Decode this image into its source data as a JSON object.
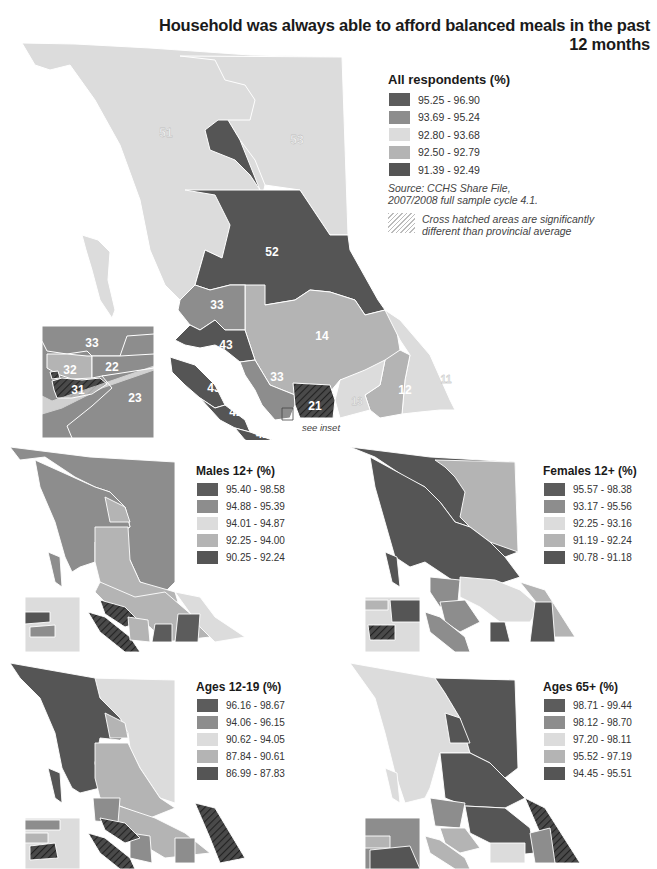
{
  "title": "Household was always able to afford balanced meals in the past 12 months",
  "colors": {
    "class1": "#5c5c5c",
    "class2": "#8d8d8d",
    "class3": "#dcdcdc",
    "class4": "#b4b4b4",
    "class5": "#555555",
    "boundary": "#ffffff"
  },
  "main_map": {
    "legend": {
      "title": "All respondents (%)",
      "classes": [
        {
          "label": "95.25 - 96.90"
        },
        {
          "label": "93.69 - 95.24"
        },
        {
          "label": "92.80 - 93.68"
        },
        {
          "label": "92.50 - 92.79"
        },
        {
          "label": "91.39 - 92.49"
        }
      ]
    },
    "source_line1": "Source: CCHS Share File,",
    "source_line2": "2007/2008 full sample cycle 4.1.",
    "hatch_line1": "Cross hatched areas are significantly",
    "hatch_line2": "different than provincial average",
    "see_inset": "see inset",
    "region_labels": {
      "r51": "51",
      "r53": "53",
      "r52": "52",
      "r33": "33",
      "r14": "14",
      "r43a": "43",
      "r43b": "43",
      "r33b": "33",
      "r42": "42",
      "r41": "41",
      "r21": "21",
      "r13": "13",
      "r12": "12",
      "r11": "11"
    },
    "inset_labels": {
      "i33": "33",
      "i22": "22",
      "i32": "32",
      "i31": "31",
      "i23": "23"
    }
  },
  "small_maps": [
    {
      "id": "males",
      "legend": {
        "title": "Males 12+ (%)",
        "classes": [
          {
            "label": "95.40 - 98.58"
          },
          {
            "label": "94.88 - 95.39"
          },
          {
            "label": "94.01 - 94.87"
          },
          {
            "label": "92.25 - 94.00"
          },
          {
            "label": "90.25 - 92.24"
          }
        ]
      }
    },
    {
      "id": "females",
      "legend": {
        "title": "Females 12+ (%)",
        "classes": [
          {
            "label": "95.57 - 98.38"
          },
          {
            "label": "93.17 - 95.56"
          },
          {
            "label": "92.25 - 93.16"
          },
          {
            "label": "91.19 - 92.24"
          },
          {
            "label": "90.78 - 91.18"
          }
        ]
      }
    },
    {
      "id": "ages-12-19",
      "legend": {
        "title": "Ages 12-19 (%)",
        "classes": [
          {
            "label": "96.16 - 98.67"
          },
          {
            "label": "94.06 - 96.15"
          },
          {
            "label": "90.62 - 94.05"
          },
          {
            "label": "87.84 - 90.61"
          },
          {
            "label": "86.99 - 87.83"
          }
        ]
      }
    },
    {
      "id": "ages-65",
      "legend": {
        "title": "Ages 65+ (%)",
        "classes": [
          {
            "label": "98.71 - 99.44"
          },
          {
            "label": "98.12 - 98.70"
          },
          {
            "label": "97.20 - 98.11"
          },
          {
            "label": "95.52 - 97.19"
          },
          {
            "label": "94.45 - 95.51"
          }
        ]
      }
    }
  ]
}
